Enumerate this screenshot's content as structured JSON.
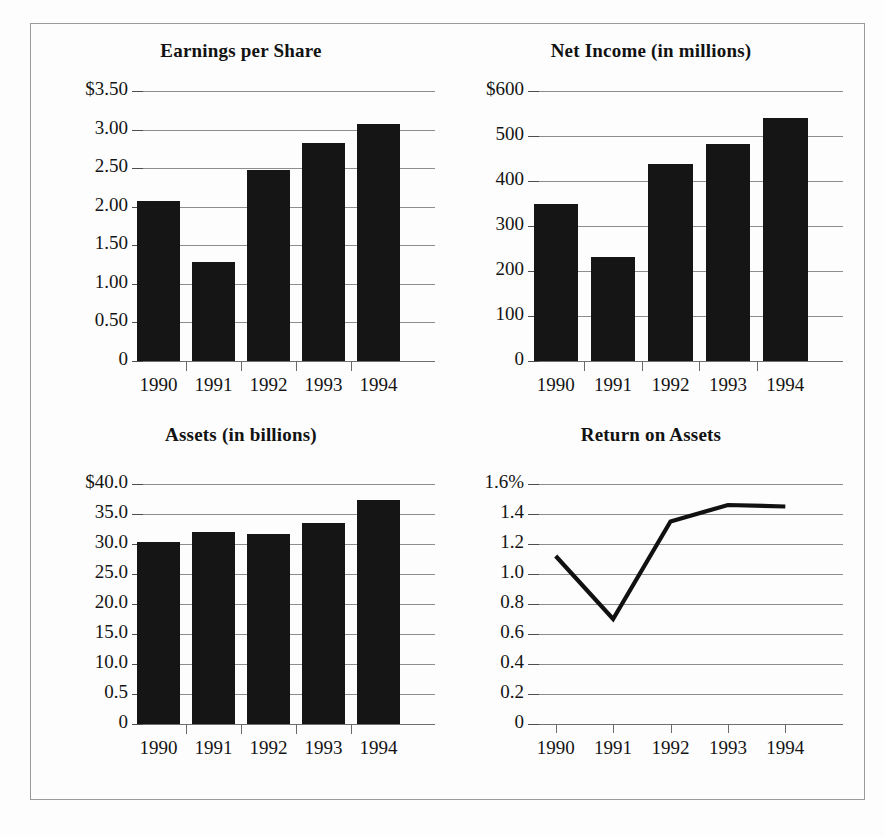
{
  "page": {
    "background_color": "#fdfdfd",
    "frame_color": "#9a9a9a",
    "bar_color": "#151515",
    "gridline_color": "#8d8d8d",
    "line_color": "#111111"
  },
  "charts": [
    {
      "key": "earnings_per_share",
      "title": "Earnings per Share",
      "y_tick_labels": [
        "$3.50",
        "3.00",
        "2.50",
        "2.00",
        "1.50",
        "1.00",
        "0.50",
        "0"
      ],
      "x_tick_labels": [
        "1990",
        "1991",
        "1992",
        "1993",
        "1994"
      ]
    },
    {
      "key": "net_income",
      "title": "Net Income (in millions)",
      "y_tick_labels": [
        "$600",
        "500",
        "400",
        "300",
        "200",
        "100",
        "0"
      ],
      "x_tick_labels": [
        "1990",
        "1991",
        "1992",
        "1993",
        "1994"
      ]
    },
    {
      "key": "assets",
      "title": "Assets (in billions)",
      "y_tick_labels": [
        "$40.0",
        "35.0",
        "30.0",
        "25.0",
        "20.0",
        "15.0",
        "10.0",
        "0.5",
        "0"
      ],
      "x_tick_labels": [
        "1990",
        "1991",
        "1992",
        "1993",
        "1994"
      ]
    },
    {
      "key": "return_on_assets",
      "title": "Return on Assets",
      "y_tick_labels": [
        "1.6%",
        "1.4",
        "1.2",
        "1.0",
        "0.8",
        "0.6",
        "0.4",
        "0.2",
        "0"
      ],
      "x_tick_labels": [
        "1990",
        "1991",
        "1992",
        "1993",
        "1994"
      ]
    }
  ],
  "chart_data": [
    {
      "type": "bar",
      "key": "earnings_per_share",
      "title": "Earnings per Share",
      "xlabel": "",
      "ylabel": "",
      "categories": [
        "1990",
        "1991",
        "1992",
        "1993",
        "1994"
      ],
      "values": [
        2.08,
        1.29,
        2.48,
        2.83,
        3.07
      ],
      "ylim": [
        0,
        3.5
      ],
      "yticks": [
        0,
        0.5,
        1.0,
        1.5,
        2.0,
        2.5,
        3.0,
        3.5
      ],
      "ytick_labels": [
        "0",
        "0.50",
        "1.00",
        "1.50",
        "2.00",
        "2.50",
        "3.00",
        "$3.50"
      ],
      "grid": true,
      "legend": false,
      "units": "US dollars per share"
    },
    {
      "type": "bar",
      "key": "net_income",
      "title": "Net Income (in millions)",
      "xlabel": "",
      "ylabel": "",
      "categories": [
        "1990",
        "1991",
        "1992",
        "1993",
        "1994"
      ],
      "values": [
        350,
        232,
        437,
        482,
        540
      ],
      "ylim": [
        0,
        600
      ],
      "yticks": [
        0,
        100,
        200,
        300,
        400,
        500,
        600
      ],
      "ytick_labels": [
        "0",
        "100",
        "200",
        "300",
        "400",
        "500",
        "$600"
      ],
      "grid": true,
      "legend": false,
      "units": "millions of US dollars"
    },
    {
      "type": "bar",
      "key": "assets",
      "title": "Assets (in billions)",
      "xlabel": "",
      "ylabel": "",
      "categories": [
        "1990",
        "1991",
        "1992",
        "1993",
        "1994"
      ],
      "values": [
        30.3,
        32.0,
        31.7,
        33.5,
        37.3
      ],
      "ylim": [
        0,
        40
      ],
      "yticks": [
        0,
        5,
        10,
        15,
        20,
        25,
        30,
        35,
        40
      ],
      "ytick_labels": [
        "0",
        "0.5",
        "10.0",
        "15.0",
        "20.0",
        "25.0",
        "30.0",
        "35.0",
        "$40.0"
      ],
      "grid": true,
      "legend": false,
      "units": "billions of US dollars",
      "note": "The tick between 0 and 10.0 is printed as 0.5 in the source image"
    },
    {
      "type": "line",
      "key": "return_on_assets",
      "title": "Return on Assets",
      "xlabel": "",
      "ylabel": "",
      "x": [
        "1990",
        "1991",
        "1992",
        "1993",
        "1994"
      ],
      "values": [
        1.12,
        0.7,
        1.35,
        1.46,
        1.45
      ],
      "ylim": [
        0,
        1.6
      ],
      "yticks": [
        0,
        0.2,
        0.4,
        0.6,
        0.8,
        1.0,
        1.2,
        1.4,
        1.6
      ],
      "ytick_labels": [
        "0",
        "0.2",
        "0.4",
        "0.6",
        "0.8",
        "1.0",
        "1.2",
        "1.4",
        "1.6%"
      ],
      "grid": true,
      "legend": false,
      "units": "percent"
    }
  ]
}
